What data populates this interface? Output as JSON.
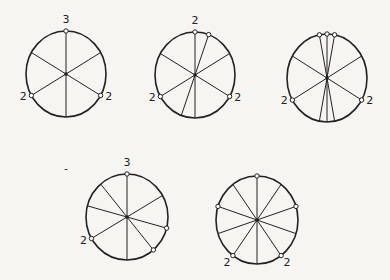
{
  "diagrams": [
    {
      "id": "wheel-1",
      "cx": 66,
      "cy": 74,
      "rx": 40,
      "ry": 43,
      "spoke_angles": [
        90,
        30,
        150,
        210,
        270,
        330
      ],
      "nodes": [
        {
          "angle": 90,
          "label": "3",
          "lx": 0,
          "ly": -8,
          "anchor": "middle"
        },
        {
          "angle": 210,
          "label": "2",
          "lx": -8,
          "ly": 4,
          "anchor": "middle"
        },
        {
          "angle": 330,
          "label": "2",
          "lx": 8,
          "ly": 4,
          "anchor": "middle"
        }
      ]
    },
    {
      "id": "wheel-2",
      "cx": 195,
      "cy": 75,
      "rx": 40,
      "ry": 43,
      "spoke_angles": [
        90,
        70,
        30,
        150,
        210,
        250,
        270,
        330
      ],
      "nodes": [
        {
          "angle": 90,
          "label": "2",
          "lx": 0,
          "ly": -8,
          "anchor": "middle"
        },
        {
          "angle": 70,
          "label": "",
          "lx": 0,
          "ly": 0,
          "anchor": "middle"
        },
        {
          "angle": 210,
          "label": "2",
          "lx": -8,
          "ly": 4,
          "anchor": "middle"
        },
        {
          "angle": 330,
          "label": "2",
          "lx": 8,
          "ly": 4,
          "anchor": "middle"
        }
      ]
    },
    {
      "id": "wheel-3",
      "cx": 327,
      "cy": 78,
      "rx": 40,
      "ry": 44,
      "spoke_angles": [
        90,
        79,
        101,
        30,
        150,
        210,
        259,
        270,
        281,
        330
      ],
      "nodes": [
        {
          "angle": 90,
          "label": "",
          "lx": 0,
          "ly": 0,
          "anchor": "middle"
        },
        {
          "angle": 79,
          "label": "",
          "lx": 0,
          "ly": 0,
          "anchor": "middle"
        },
        {
          "angle": 101,
          "label": "",
          "lx": 0,
          "ly": 0,
          "anchor": "middle"
        },
        {
          "angle": 210,
          "label": "2",
          "lx": -8,
          "ly": 4,
          "anchor": "middle"
        },
        {
          "angle": 330,
          "label": "2",
          "lx": 8,
          "ly": 4,
          "anchor": "middle"
        }
      ]
    },
    {
      "id": "wheel-4",
      "cx": 127,
      "cy": 217,
      "rx": 41,
      "ry": 43,
      "spoke_angles": [
        90,
        30,
        130,
        165,
        210,
        270,
        310,
        345
      ],
      "nodes": [
        {
          "angle": 90,
          "label": "3",
          "lx": 0,
          "ly": -8,
          "anchor": "middle"
        },
        {
          "angle": 210,
          "label": "2",
          "lx": -8,
          "ly": 5,
          "anchor": "middle"
        },
        {
          "angle": 310,
          "label": "",
          "lx": 0,
          "ly": 0,
          "anchor": "middle"
        },
        {
          "angle": 345,
          "label": "",
          "lx": 0,
          "ly": 0,
          "anchor": "middle"
        }
      ]
    },
    {
      "id": "wheel-5",
      "cx": 257,
      "cy": 220,
      "rx": 41,
      "ry": 44,
      "spoke_angles": [
        90,
        54,
        126,
        18,
        162,
        198,
        234,
        270,
        306,
        342
      ],
      "nodes": [
        {
          "angle": 90,
          "label": "",
          "lx": 0,
          "ly": 0,
          "anchor": "middle"
        },
        {
          "angle": 18,
          "label": "",
          "lx": 0,
          "ly": 0,
          "anchor": "middle"
        },
        {
          "angle": 162,
          "label": "",
          "lx": 0,
          "ly": 0,
          "anchor": "middle"
        },
        {
          "angle": 234,
          "label": "2",
          "lx": -6,
          "ly": 10,
          "anchor": "middle"
        },
        {
          "angle": 306,
          "label": "2",
          "lx": 6,
          "ly": 10,
          "anchor": "middle"
        }
      ]
    }
  ],
  "stray_mark": {
    "x": 64,
    "y": 172,
    "text": "-"
  }
}
